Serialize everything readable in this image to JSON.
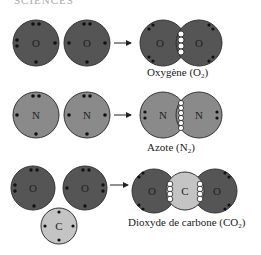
{
  "header": {
    "partial_text": "SCIENCES"
  },
  "colors": {
    "oxygen": "#555555",
    "nitrogen": "#8a8a8a",
    "carbon": "#c4c4c4",
    "outline": "#333333",
    "electron": "#111111",
    "bond_electron": "#ffffff"
  },
  "rows": [
    {
      "reactants": [
        "O",
        "O"
      ],
      "product_atoms": [
        "O",
        "O"
      ],
      "caption": "Oxygène (O",
      "subscript": "2",
      "caption_end": ")"
    },
    {
      "reactants": [
        "N",
        "N"
      ],
      "product_atoms": [
        "N",
        "N"
      ],
      "caption": "Azote (N",
      "subscript": "2",
      "caption_end": ")"
    },
    {
      "reactants": [
        "O",
        "O",
        "C"
      ],
      "product_atoms": [
        "O",
        "C",
        "O"
      ],
      "caption": "Dioxyde de carbone (CO",
      "subscript": "2",
      "caption_end": ")"
    }
  ]
}
